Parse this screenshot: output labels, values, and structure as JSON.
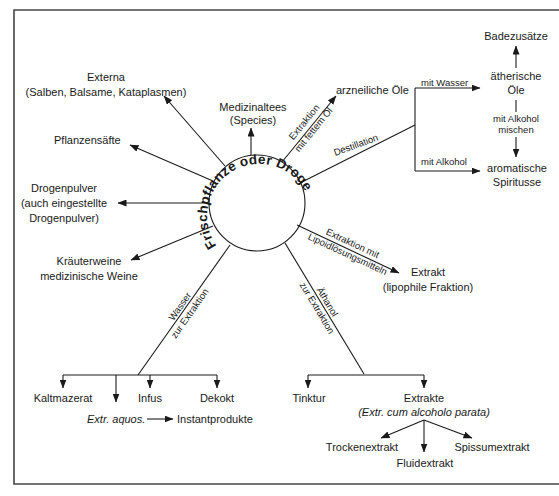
{
  "diagram": {
    "center": "Frischpflanze oder Droge",
    "nodes": {
      "externa_1": "Externa",
      "externa_2": "(Salben, Balsame, Kataplasmen)",
      "medizinaltees_1": "Medizinaltees",
      "medizinaltees_2": "(Species)",
      "pflanzensaefte": "Pflanzensäfte",
      "drogenpulver_1": "Drogenpulver",
      "drogenpulver_2": "(auch eingestellte",
      "drogenpulver_3": "Drogenpulver)",
      "kraeuterweine_1": "Kräuterweine",
      "kraeuterweine_2": "medizinische Weine",
      "arzneiliche_oele": "arzneiliche Öle",
      "badezusaetze": "Badezusätze",
      "aetherische_oele_1": "ätherische",
      "aetherische_oele_2": "Öle",
      "mit_alkohol_mischen_1": "mit Alkohol",
      "mit_alkohol_mischen_2": "mischen",
      "aromatische_spirituose_1": "aromatische",
      "aromatische_spirituose_2": "Spiritusse",
      "extrakt_lipophil_1": "Extrakt",
      "extrakt_lipophil_2": "(lipophile Fraktion)",
      "kaltmazerat": "Kaltmazerat",
      "extr_aquos": "Extr. aquos.",
      "infus": "Infus",
      "dekokt": "Dekokt",
      "instantprodukte": "Instantprodukte",
      "tinktur": "Tinktur",
      "extrakte_1": "Extrakte",
      "extrakte_2": "(Extr. cum alcoholo parata)",
      "trockenextrakt": "Trockenextrakt",
      "fluidextrakt": "Fluidextrakt",
      "spissumextrakt": "Spissumextrakt"
    },
    "edge_labels": {
      "fettes_oel_1": "Extraktion",
      "fettes_oel_2": "mit fettem Öl",
      "destillation": "Destillation",
      "mit_wasser": "mit Wasser",
      "mit_alkohol": "mit Alkohol",
      "lipoid_1": "Extraktion mit",
      "lipoid_2": "Lipoidlösungsmitteln",
      "wasser_1": "Wasser",
      "wasser_2": "zur Extraktion",
      "aethanol_1": "Äthanol",
      "aethanol_2": "zur Extraktion"
    },
    "colors": {
      "ink": "#1a1a1a",
      "frame": "#444444",
      "background": "#ffffff"
    }
  }
}
